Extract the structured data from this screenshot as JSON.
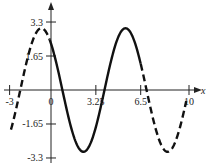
{
  "chart_data": {
    "type": "line",
    "title": "",
    "xlabel": "x",
    "ylabel": "",
    "xlim": [
      -3.2,
      11
    ],
    "ylim": [
      -3.3,
      3.5
    ],
    "grid": false,
    "x_ticks": [
      -3,
      0,
      3.25,
      6.5,
      10
    ],
    "x_tick_labels": [
      "-3",
      "0",
      "3.25",
      "6.5",
      "10"
    ],
    "y_ticks": [
      3.3,
      1.65,
      -1.65,
      -3.3
    ],
    "y_tick_labels": [
      "3.3",
      "1.65",
      "-1.65",
      "-3.3"
    ],
    "series": [
      {
        "name": "sinusoid",
        "function": "y ≈ 3.0·cos(2π(x + 0.7)/6.1)",
        "amplitude": 3.0,
        "period": 6.1,
        "key_points": [
          {
            "x": -0.7,
            "y": 3.0,
            "kind": "max"
          },
          {
            "x": 2.3,
            "y": -3.0,
            "kind": "min"
          },
          {
            "x": 5.4,
            "y": 3.0,
            "kind": "max"
          },
          {
            "x": 8.5,
            "y": -3.0,
            "kind": "min"
          }
        ],
        "segments": [
          {
            "from": -2.9,
            "to": -0.1,
            "style": "dashed"
          },
          {
            "from": -0.1,
            "to": 6.5,
            "style": "solid"
          },
          {
            "from": 6.5,
            "to": 9.8,
            "style": "dashed"
          }
        ]
      }
    ],
    "colors": {
      "line": "#111111",
      "axis": "#222222"
    }
  }
}
